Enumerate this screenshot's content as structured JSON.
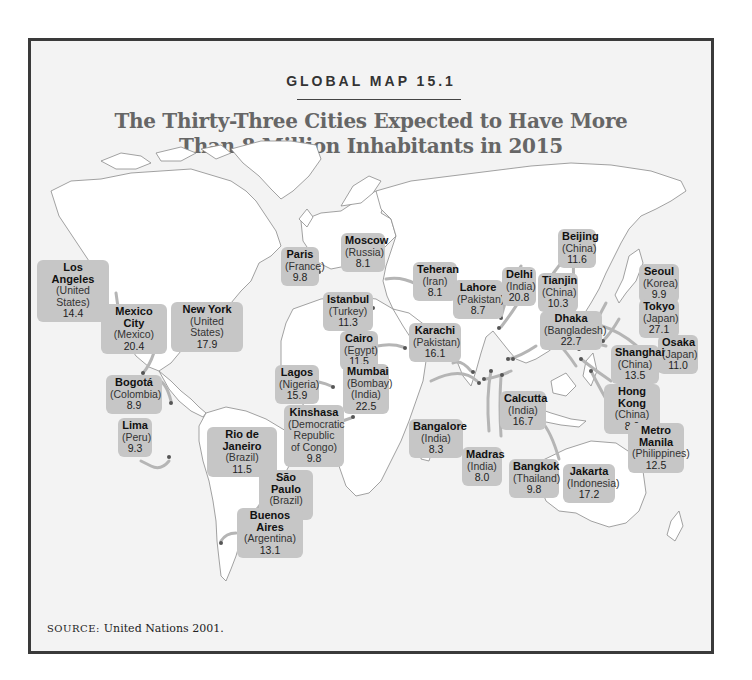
{
  "header": {
    "kicker": "GLOBAL MAP 15.1",
    "title_line1": "The Thirty-Three Cities Expected to Have More",
    "title_line2": "Than 8 Million Inhabitants in 2015"
  },
  "source": {
    "label": "SOURCE:",
    "text": "United Nations 2001."
  },
  "colors": {
    "frame_border": "#3a3a3a",
    "background": "#f3f3f3",
    "land": "#ffffff",
    "label_box": "#c6c6c6",
    "title": "#666666"
  },
  "cities": [
    {
      "city": "Los Angeles",
      "country": "(United States)",
      "pop": "14.4"
    },
    {
      "city": "Mexico City",
      "country": "(Mexico)",
      "pop": "20.4"
    },
    {
      "city": "New York",
      "country": "(United States)",
      "pop": "17.9"
    },
    {
      "city": "Bogotá",
      "country": "(Colombia)",
      "pop": "8.9"
    },
    {
      "city": "Lima",
      "country": "(Peru)",
      "pop": "9.3"
    },
    {
      "city": "Rio de Janeiro",
      "country": "(Brazil)",
      "pop": "11.5"
    },
    {
      "city": "São Paulo",
      "country": "(Brazil)",
      "pop": "21.2"
    },
    {
      "city": "Buenos Aires",
      "country": "(Argentina)",
      "pop": "13.1"
    },
    {
      "city": "Paris",
      "country": "(France)",
      "pop": "9.8"
    },
    {
      "city": "Moscow",
      "country": "(Russia)",
      "pop": "8.1"
    },
    {
      "city": "Istanbul",
      "country": "(Turkey)",
      "pop": "11.3"
    },
    {
      "city": "Cairo",
      "country": "(Egypt)",
      "pop": "11.5"
    },
    {
      "city": "Lagos",
      "country": "(Nigeria)",
      "pop": "15.9"
    },
    {
      "city": "Kinshasa",
      "country": "(Democratic Republic of Congo)",
      "pop": "9.8"
    },
    {
      "city": "Teheran",
      "country": "(Iran)",
      "pop": "8.1"
    },
    {
      "city": "Karachi",
      "country": "(Pakistan)",
      "pop": "16.1"
    },
    {
      "city": "Mumbai",
      "country": "(Bombay) (India)",
      "pop": "22.5"
    },
    {
      "city": "Lahore",
      "country": "(Pakistan)",
      "pop": "8.7"
    },
    {
      "city": "Delhi",
      "country": "(India)",
      "pop": "20.8"
    },
    {
      "city": "Dhaka",
      "country": "(Bangladesh)",
      "pop": "22.7"
    },
    {
      "city": "Bangalore",
      "country": "(India)",
      "pop": "8.3"
    },
    {
      "city": "Calcutta",
      "country": "(India)",
      "pop": "16.7"
    },
    {
      "city": "Madras",
      "country": "(India)",
      "pop": "8.0"
    },
    {
      "city": "Bangkok",
      "country": "(Thailand)",
      "pop": "9.8"
    },
    {
      "city": "Beijing",
      "country": "(China)",
      "pop": "11.6"
    },
    {
      "city": "Tianjin",
      "country": "(China)",
      "pop": "10.3"
    },
    {
      "city": "Seoul",
      "country": "(Korea)",
      "pop": "9.9"
    },
    {
      "city": "Tokyo",
      "country": "(Japan)",
      "pop": "27.1"
    },
    {
      "city": "Osaka",
      "country": "(Japan)",
      "pop": "11.0"
    },
    {
      "city": "Shanghai",
      "country": "(China)",
      "pop": "13.5"
    },
    {
      "city": "Hong Kong",
      "country": "(China)",
      "pop": "8.0"
    },
    {
      "city": "Metro Manila",
      "country": "(Philippines)",
      "pop": "12.5"
    },
    {
      "city": "Jakarta",
      "country": "(Indonesia)",
      "pop": "17.2"
    }
  ]
}
